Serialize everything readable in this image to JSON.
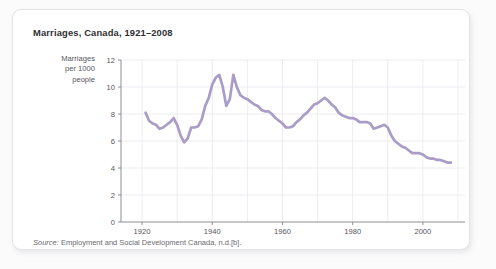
{
  "figure": {
    "title": "Marriages, Canada, 1921–2008",
    "y_axis_label_lines": [
      "Marriages",
      "per 1000",
      "people"
    ],
    "source_label": "Source:",
    "source_text": " Employment and Social Development Canada, n.d.[b]."
  },
  "colors": {
    "line": "#a99dc7",
    "grid": "#e9e9ee",
    "axis": "#8e8e96",
    "text": "#56565c",
    "title": "#2f2f33",
    "card_bg": "#ffffff",
    "card_border": "#e3e3e6",
    "page_bg": "#fbfbfc"
  },
  "chart_data": {
    "type": "line",
    "title": "Marriages, Canada, 1921–2008",
    "xlabel": "",
    "ylabel": "Marriages per 1000 people",
    "xlim": [
      1914,
      2012
    ],
    "ylim": [
      0,
      12
    ],
    "xticks": [
      1920,
      1940,
      1960,
      1980,
      2000
    ],
    "yticks": [
      0,
      2,
      4,
      6,
      8,
      10,
      12
    ],
    "grid": true,
    "legend": "none",
    "series": [
      {
        "name": "Marriages per 1000 people",
        "color": "#a99dc7",
        "x": [
          1921,
          1922,
          1923,
          1924,
          1925,
          1926,
          1927,
          1928,
          1929,
          1930,
          1931,
          1932,
          1933,
          1934,
          1935,
          1936,
          1937,
          1938,
          1939,
          1940,
          1941,
          1942,
          1943,
          1944,
          1945,
          1946,
          1947,
          1948,
          1949,
          1950,
          1951,
          1952,
          1953,
          1954,
          1955,
          1956,
          1957,
          1958,
          1959,
          1960,
          1961,
          1962,
          1963,
          1964,
          1965,
          1966,
          1967,
          1968,
          1969,
          1970,
          1971,
          1972,
          1973,
          1974,
          1975,
          1976,
          1977,
          1978,
          1979,
          1980,
          1981,
          1982,
          1983,
          1984,
          1985,
          1986,
          1987,
          1988,
          1989,
          1990,
          1991,
          1992,
          1993,
          1994,
          1995,
          1996,
          1997,
          1998,
          1999,
          2000,
          2001,
          2002,
          2003,
          2004,
          2005,
          2006,
          2007,
          2008
        ],
        "y": [
          8.1,
          7.5,
          7.3,
          7.2,
          6.9,
          7.0,
          7.2,
          7.4,
          7.7,
          7.2,
          6.4,
          5.9,
          6.2,
          7.0,
          7.0,
          7.1,
          7.6,
          8.6,
          9.2,
          10.2,
          10.7,
          10.9,
          10.0,
          8.6,
          9.1,
          10.9,
          10.0,
          9.4,
          9.2,
          9.1,
          8.9,
          8.7,
          8.6,
          8.3,
          8.2,
          8.2,
          8.0,
          7.7,
          7.5,
          7.3,
          7.0,
          7.0,
          7.1,
          7.4,
          7.6,
          7.9,
          8.1,
          8.4,
          8.7,
          8.8,
          9.0,
          9.2,
          9.0,
          8.7,
          8.5,
          8.1,
          7.9,
          7.8,
          7.7,
          7.7,
          7.6,
          7.4,
          7.4,
          7.4,
          7.3,
          6.9,
          7.0,
          7.1,
          7.2,
          7.0,
          6.4,
          6.0,
          5.8,
          5.6,
          5.5,
          5.3,
          5.1,
          5.1,
          5.1,
          5.0,
          4.8,
          4.7,
          4.7,
          4.6,
          4.6,
          4.5,
          4.4,
          4.4
        ]
      }
    ]
  }
}
